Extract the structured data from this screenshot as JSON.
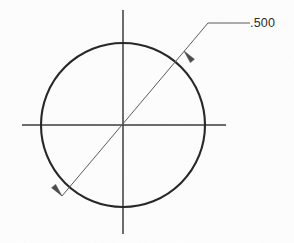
{
  "drawing": {
    "title": "Circle with diameter dimension",
    "background_color": "#fdfdfd",
    "outline_color": "#262626",
    "centerline_color": "#3a3a3a",
    "dimension_color": "#5a5a5a",
    "text_color": "#2b2b2b"
  },
  "dimension": {
    "value_label": ".500",
    "type": "diameter",
    "leader_shoulder_label": "",
    "arrow_count": 2
  },
  "chart_data": {
    "type": "diagram",
    "shapes": [
      {
        "name": "circle",
        "kind": "circle",
        "cx": 123,
        "cy": 125,
        "r": 82,
        "stroke": "#262626",
        "stroke_width": 2.1,
        "fill": "none"
      },
      {
        "name": "horizontal-centerline",
        "kind": "line",
        "x1": 22,
        "y1": 125,
        "x2": 226,
        "y2": 125,
        "stroke": "#3a3a3a",
        "stroke_width": 1.5
      },
      {
        "name": "vertical-centerline",
        "kind": "line",
        "x1": 123,
        "y1": 10,
        "x2": 123,
        "y2": 234,
        "stroke": "#3a3a3a",
        "stroke_width": 1.5
      },
      {
        "name": "diameter-leader-line",
        "kind": "line",
        "x1": 62,
        "y1": 196,
        "x2": 208,
        "y2": 23,
        "stroke": "#5a5a5a",
        "stroke_width": 1.0
      },
      {
        "name": "leader-shoulder-line",
        "kind": "line",
        "x1": 208,
        "y1": 23,
        "x2": 250,
        "y2": 23,
        "stroke": "#5a5a5a",
        "stroke_width": 1.0
      }
    ],
    "arrowheads": [
      {
        "name": "lower-left-arrowhead",
        "tip_x": 62,
        "tip_y": 196,
        "angle_deg": 229.8,
        "length": 13,
        "half_width": 2.6,
        "fill": "#4a4a4a"
      },
      {
        "name": "upper-right-arrowhead",
        "tip_x": 184,
        "tip_y": 51,
        "angle_deg": 49.8,
        "length": 13,
        "half_width": 2.6,
        "fill": "#4a4a4a"
      }
    ],
    "annotations": [
      {
        "name": "diameter-value-text",
        "text": ".500",
        "x": 250,
        "y": 17,
        "color": "#2b2b2b",
        "font_size": 12.5
      }
    ],
    "axis_ranges": {
      "x": [
        0,
        294
      ],
      "y": [
        0,
        243
      ]
    },
    "grid": false,
    "legend": false
  }
}
